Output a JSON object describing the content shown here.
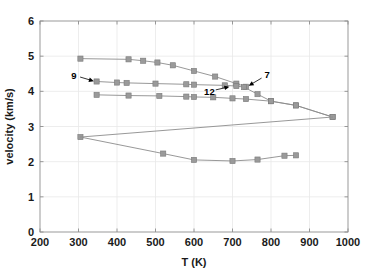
{
  "chart_data": {
    "type": "line",
    "title": "",
    "xlabel": "T (K)",
    "ylabel": "velocity (km/s)",
    "xlim": [
      200,
      1000
    ],
    "ylim": [
      0,
      6
    ],
    "xticks": [
      200,
      300,
      400,
      500,
      600,
      700,
      800,
      900,
      1000
    ],
    "yticks": [
      0,
      1,
      2,
      3,
      4,
      5,
      6
    ],
    "xticklabels": [
      "200",
      "300",
      "400",
      "500",
      "600",
      "700",
      "800",
      "900",
      "1000"
    ],
    "yticklabels": [
      "0",
      "1",
      "2",
      "3",
      "4",
      "5",
      "6"
    ],
    "grid": true,
    "legend": "none",
    "marker": "square",
    "marker_color": "#9a9a9a",
    "line_color": "#8c8c8c",
    "series": [
      {
        "name": "upper-branch",
        "x": [
          305,
          430,
          468,
          505,
          545,
          600,
          655,
          710,
          735
        ],
        "y": [
          4.93,
          4.91,
          4.87,
          4.82,
          4.74,
          4.58,
          4.42,
          4.22,
          4.13
        ]
      },
      {
        "name": "middle-branch-upper",
        "x": [
          347,
          400,
          425,
          500,
          580,
          600,
          680,
          710,
          730,
          765,
          800,
          865,
          960
        ],
        "y": [
          4.28,
          4.25,
          4.24,
          4.22,
          4.2,
          4.19,
          4.17,
          4.15,
          4.12,
          3.92,
          3.72,
          3.6,
          3.27
        ]
      },
      {
        "name": "middle-branch-lower",
        "x": [
          347,
          430,
          510,
          580,
          600,
          650,
          700,
          735,
          800,
          865,
          960
        ],
        "y": [
          3.9,
          3.88,
          3.87,
          3.85,
          3.84,
          3.83,
          3.8,
          3.78,
          3.72,
          3.6,
          3.27
        ]
      },
      {
        "name": "lower-branch",
        "x": [
          305,
          520,
          600,
          700,
          765,
          835,
          865
        ],
        "y": [
          2.7,
          2.23,
          2.05,
          2.02,
          2.06,
          2.17,
          2.18
        ]
      },
      {
        "name": "connector-branch",
        "x": [
          305,
          960
        ],
        "y": [
          2.7,
          3.27
        ]
      }
    ],
    "annotations": [
      {
        "label": "9",
        "label_x": 288,
        "label_y": 4.46,
        "tip_x": 340,
        "tip_y": 4.29
      },
      {
        "label": "12",
        "label_x": 640,
        "label_y": 4.0,
        "tip_x": 692,
        "tip_y": 4.13
      },
      {
        "label": "7",
        "label_x": 790,
        "label_y": 4.47,
        "tip_x": 742,
        "tip_y": 4.16
      }
    ]
  }
}
